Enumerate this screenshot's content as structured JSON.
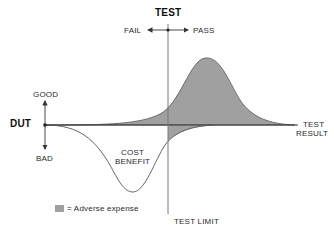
{
  "title": "TEST",
  "direction": {
    "fail": "FAIL",
    "pass": "PASS"
  },
  "y_axis": {
    "label": "DUT",
    "top": "GOOD",
    "bottom": "BAD"
  },
  "x_axis": {
    "label_line1": "TEST",
    "label_line2": "RESULT"
  },
  "curve_label": {
    "line1": "COST",
    "line2": "BENEFIT"
  },
  "test_limit_label": "TEST LIMIT",
  "legend": {
    "text": "= Adverse expense",
    "color": "#a0a0a0"
  },
  "colors": {
    "line": "#555555",
    "fill": "#a0a0a0",
    "axis": "#333333"
  }
}
